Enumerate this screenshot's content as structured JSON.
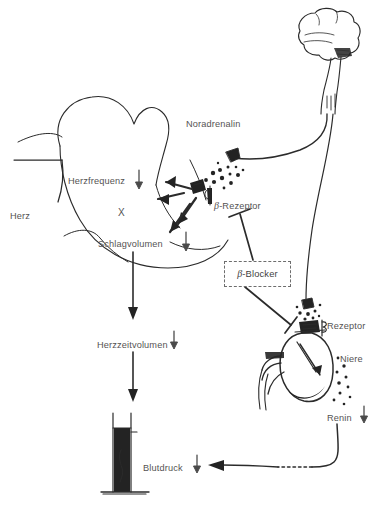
{
  "diagram": {
    "language": "de",
    "background_color": "#ffffff",
    "ink_color": "#232323",
    "label_color": "#555353",
    "labels": [
      {
        "id": "noradrenalin",
        "text": "Noradrenalin",
        "x": 186,
        "y": 120,
        "arrow": "none"
      },
      {
        "id": "herz",
        "text": "Herz",
        "x": 10,
        "y": 212,
        "arrow": "none"
      },
      {
        "id": "herzfrequenz",
        "text": "Herzfrequenz",
        "x": 68,
        "y": 177,
        "arrow": "down"
      },
      {
        "id": "x-marker",
        "text": "X",
        "x": 118,
        "y": 208,
        "arrow": "none"
      },
      {
        "id": "schlagvolumen",
        "text": "Schlagvolumen",
        "x": 98,
        "y": 240,
        "arrow": "down"
      },
      {
        "id": "beta-rezeptor-herz",
        "text": "-Rezeptor",
        "x": 214,
        "y": 201,
        "prefix": "β",
        "arrow": "none"
      },
      {
        "id": "beta-blocker",
        "text": "-Blocker",
        "x": 237,
        "y": 272,
        "prefix": "β",
        "arrow": "none"
      },
      {
        "id": "herzzeitvolumen",
        "text": "Herzzeitvolumen",
        "x": 97,
        "y": 341,
        "arrow": "down"
      },
      {
        "id": "rezeptor-niere",
        "text": "Rezeptor",
        "x": 327,
        "y": 322,
        "arrow": "none"
      },
      {
        "id": "niere",
        "text": "Niere",
        "x": 340,
        "y": 355,
        "arrow": "none"
      },
      {
        "id": "renin",
        "text": "Renin",
        "x": 327,
        "y": 414,
        "arrow": "down"
      },
      {
        "id": "blutdruck",
        "text": "Blutdruck",
        "x": 143,
        "y": 464,
        "arrow": "down"
      }
    ],
    "beta_blocker_box": {
      "label_prefix": "β",
      "label_text": "-Blocker",
      "border_style": "dashed",
      "x": 224,
      "y": 261,
      "width": 65,
      "height": 24
    },
    "organs": [
      {
        "id": "brain",
        "name": "Gehirn",
        "x": 300,
        "y": 15
      },
      {
        "id": "heart",
        "name": "Herz",
        "x": 30,
        "y": 95
      },
      {
        "id": "kidney",
        "name": "Niere",
        "x": 270,
        "y": 320
      },
      {
        "id": "manometer",
        "name": "Blutdruck-Manometer",
        "x": 105,
        "y": 410
      }
    ],
    "connections": [
      {
        "id": "brain-to-heart-nerve",
        "from": "brain",
        "to": "heart-synapse",
        "type": "nerve"
      },
      {
        "id": "brain-to-kidney-nerve",
        "from": "brain",
        "to": "kidney-synapse",
        "type": "nerve"
      },
      {
        "id": "blocker-to-heart-receptor",
        "from": "beta-blocker",
        "to": "beta-rezeptor-herz",
        "type": "inhibition"
      },
      {
        "id": "blocker-to-kidney-receptor",
        "from": "beta-blocker",
        "to": "rezeptor-niere",
        "type": "inhibition"
      },
      {
        "id": "heart-to-hzv",
        "from": "heart",
        "to": "herzzeitvolumen",
        "type": "arrow"
      },
      {
        "id": "hzv-to-manometer",
        "from": "herzzeitvolumen",
        "to": "manometer",
        "type": "arrow"
      },
      {
        "id": "renin-to-blutdruck",
        "from": "renin",
        "to": "blutdruck",
        "type": "arrow-dashed"
      }
    ]
  }
}
